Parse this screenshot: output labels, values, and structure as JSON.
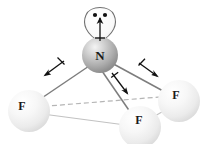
{
  "figure": {
    "molecule": "NF3",
    "background_color": "#ffffff",
    "central_atom": {
      "symbol": "N",
      "name": "nitrogen",
      "x": 100,
      "y": 55,
      "radius": 18,
      "sphere_color": "#b9b9b9",
      "label_color": "#1a1a1a",
      "label_font_size": 13
    },
    "outer_atoms": [
      {
        "symbol": "F",
        "name": "fluorine-left",
        "x": 29,
        "y": 111,
        "radius": 21,
        "sphere_color": "#efefef",
        "label_x": 22,
        "label_y": 110,
        "label_font_size": 12
      },
      {
        "symbol": "F",
        "name": "fluorine-right",
        "x": 179,
        "y": 101,
        "radius": 21,
        "sphere_color": "#efefef",
        "label_x": 176,
        "label_y": 99,
        "label_font_size": 12
      },
      {
        "symbol": "F",
        "name": "fluorine-front",
        "x": 140,
        "y": 127,
        "radius": 21,
        "sphere_color": "#efefef",
        "label_x": 139,
        "label_y": 124,
        "label_font_size": 12
      }
    ],
    "bonds": [
      {
        "name": "bond-n-f-left",
        "x1": 93,
        "y1": 63,
        "x2": 30,
        "y2": 105,
        "style": "solid",
        "color": "#777777"
      },
      {
        "name": "bond-n-f-right",
        "x1": 110,
        "y1": 62,
        "x2": 175,
        "y2": 97,
        "style": "solid",
        "color": "#777777"
      },
      {
        "name": "bond-n-f-front",
        "x1": 102,
        "y1": 72,
        "x2": 137,
        "y2": 121,
        "style": "solid",
        "color": "#777777"
      }
    ],
    "base_edges": [
      {
        "name": "edge-f-left-to-f-right",
        "x1": 36,
        "y1": 107,
        "x2": 172,
        "y2": 96,
        "style": "dashed",
        "color": "#b5b5b5"
      },
      {
        "name": "edge-f-left-to-f-front",
        "x1": 35,
        "y1": 113,
        "x2": 133,
        "y2": 126,
        "style": "solid",
        "color": "#bdbdbd"
      },
      {
        "name": "edge-f-front-to-f-right",
        "x1": 146,
        "y1": 121,
        "x2": 176,
        "y2": 104,
        "style": "solid",
        "color": "#bdbdbd"
      }
    ],
    "lone_pair": {
      "name": "lone-pair-lobe",
      "dots": [
        {
          "x": 95,
          "y": 15
        },
        {
          "x": 105,
          "y": 15
        }
      ],
      "dot_radius": 2,
      "dot_color": "#111111",
      "lobe_color": "#6f6f6f",
      "lobe_fill": "#f2f2f2"
    },
    "dipole_arrows": [
      {
        "name": "dipole-arrow-lone-pair",
        "direction": "up",
        "tail_x": 100,
        "tail_y": 41,
        "head_x": 100,
        "head_y": 17,
        "cross_x": 100,
        "cross_y": 38,
        "color": "#111111"
      },
      {
        "name": "dipole-arrow-left",
        "direction": "down-left",
        "tail_x": 64,
        "tail_y": 61,
        "head_x": 44,
        "head_y": 76,
        "cross_x": 61,
        "cross_y": 63,
        "color": "#111111"
      },
      {
        "name": "dipole-arrow-right",
        "direction": "down-right",
        "tail_x": 139,
        "tail_y": 63,
        "head_x": 158,
        "head_y": 77,
        "cross_x": 141,
        "cross_y": 65,
        "color": "#111111"
      },
      {
        "name": "dipole-arrow-front",
        "direction": "down-right-front",
        "tail_x": 112,
        "tail_y": 73,
        "head_x": 128,
        "head_y": 95,
        "cross_x": 115,
        "cross_y": 77,
        "color": "#111111"
      }
    ]
  }
}
